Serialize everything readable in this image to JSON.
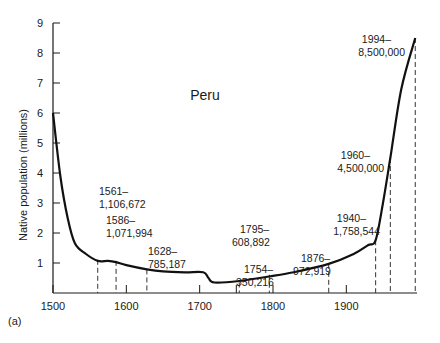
{
  "chart_data": {
    "type": "line",
    "title": "Peru",
    "xlabel": "",
    "ylabel": "Native population (millions)",
    "panel_label": "(a)",
    "xlim": [
      1500,
      1994
    ],
    "ylim": [
      0,
      9
    ],
    "x_ticks": [
      1500,
      1600,
      1700,
      1800,
      1900
    ],
    "y_ticks": [
      1,
      2,
      3,
      4,
      5,
      6,
      7,
      8,
      9
    ],
    "grid": false,
    "legend": "none",
    "series": [
      {
        "name": "Native population",
        "x": [
          1500,
          1510,
          1520,
          1530,
          1545,
          1561,
          1575,
          1586,
          1600,
          1628,
          1650,
          1680,
          1705,
          1712,
          1720,
          1754,
          1795,
          1830,
          1876,
          1910,
          1930,
          1940,
          1950,
          1960,
          1975,
          1994
        ],
        "values": [
          6.0,
          3.9,
          2.5,
          1.65,
          1.3,
          1.07,
          1.07,
          1.03,
          0.93,
          0.79,
          0.72,
          0.69,
          0.69,
          0.5,
          0.35,
          0.4,
          0.55,
          0.7,
          0.97,
          1.3,
          1.6,
          1.76,
          3.0,
          4.5,
          6.8,
          8.5
        ]
      }
    ],
    "annotations": [
      {
        "year": 1561,
        "label_year": "1561–",
        "label_value": "1,106,672",
        "value": 1106672
      },
      {
        "year": 1586,
        "label_year": "1586–",
        "label_value": "1,071,994",
        "value": 1071994
      },
      {
        "year": 1628,
        "label_year": "1628–",
        "label_value": "785,187",
        "value": 785187
      },
      {
        "year": 1754,
        "label_year": "1754–",
        "label_value": "350,216",
        "value": 350216
      },
      {
        "year": 1795,
        "label_year": "1795–",
        "label_value": "608,892",
        "value": 608892
      },
      {
        "year": 1876,
        "label_year": "1876–",
        "label_value": "972,919",
        "value": 972919
      },
      {
        "year": 1940,
        "label_year": "1940–",
        "label_value": "1,758,544",
        "value": 1758544
      },
      {
        "year": 1960,
        "label_year": "1960–",
        "label_value": "4,500,000",
        "value": 4500000
      },
      {
        "year": 1994,
        "label_year": "1994–",
        "label_value": "8,500,000",
        "value": 8500000
      }
    ],
    "colors": {
      "line": "#111111",
      "axis": "#1a1a1a",
      "dash": "#333333"
    }
  }
}
